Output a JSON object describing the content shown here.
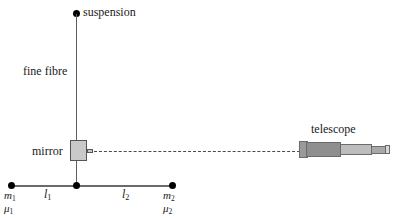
{
  "diagram": {
    "labels": {
      "suspension": "suspension",
      "fine_fibre": "fine fibre",
      "mirror": "mirror",
      "telescope": "telescope",
      "length_1": "l",
      "length_1_sub": "1",
      "length_2": "l",
      "length_2_sub": "2",
      "mass_1": "m",
      "mass_1_sub": "1",
      "mu_1": "μ",
      "mu_1_sub": "1",
      "mass_2": "m",
      "mass_2_sub": "2",
      "mu_2": "μ",
      "mu_2_sub": "2"
    },
    "colors": {
      "background": "#ffffff",
      "ink": "#1a1a1a",
      "line": "#5e5e5e",
      "rod": "#6a6a6a",
      "dashed_sightline": "#4a4a4a",
      "mirror_fill": "#c9c9c9",
      "mirror_stroke": "#555555",
      "telescope_objective": "#9a9a9a",
      "telescope_body": "#8f8f8f",
      "telescope_mid": "#bdbdbd",
      "telescope_draw": "#a8a8a8",
      "telescope_eyepiece": "#d8d8d8"
    },
    "icons": {
      "suspension_point": "filled-dot",
      "mass_node": "filled-dot",
      "mirror": "gray-square",
      "sight_line": "dashed-line",
      "telescope": "tapered-tube"
    }
  }
}
